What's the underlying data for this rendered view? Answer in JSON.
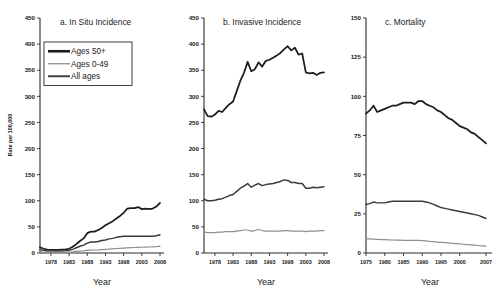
{
  "figure": {
    "background": "#ffffff",
    "series_colors": {
      "ages_50plus": "#1c1c1c",
      "ages_0_49": "#8f8f8f",
      "all_ages": "#3a3a3a"
    },
    "shared_ylabel": "Rate per 100,000",
    "shared_xlabel": "Year",
    "legend": {
      "position": "panel-a upper-left",
      "entries": [
        {
          "label": "Ages 50+",
          "color": "#1c1c1c",
          "width": 2.6
        },
        {
          "label": "Ages 0-49",
          "color": "#8f8f8f",
          "width": 1.3
        },
        {
          "label": "All ages",
          "color": "#3a3a3a",
          "width": 1.9
        }
      ]
    }
  },
  "chart_data": [
    {
      "type": "line",
      "id": "panel-a",
      "title": "a. In Situ Incidence",
      "xlabel": "Year",
      "ylabel": "Rate per 100,000",
      "xlim": [
        1975,
        2008
      ],
      "ylim": [
        0,
        450
      ],
      "yticks": [
        0,
        50,
        100,
        150,
        200,
        250,
        300,
        350,
        400,
        450
      ],
      "xticks": [
        1978,
        1983,
        1988,
        1993,
        1998,
        2003,
        2008
      ],
      "xticklabels": [
        "1978",
        "1983",
        "1988",
        "1993",
        "1998",
        "2003",
        "2008"
      ],
      "grid": false,
      "legend_shown": true,
      "x": [
        1975,
        1976,
        1977,
        1978,
        1979,
        1980,
        1981,
        1982,
        1983,
        1984,
        1985,
        1986,
        1987,
        1988,
        1989,
        1990,
        1991,
        1992,
        1993,
        1994,
        1995,
        1996,
        1997,
        1998,
        1999,
        2000,
        2001,
        2002,
        2003,
        2004,
        2005,
        2006,
        2007,
        2008
      ],
      "series": [
        {
          "name": "Ages 50+",
          "color": "#1c1c1c",
          "values": [
            11,
            8,
            6.5,
            6,
            6,
            6,
            6.5,
            7,
            8,
            12,
            17,
            23,
            28,
            38,
            41,
            41,
            44,
            48,
            53,
            57,
            61,
            66,
            71,
            77,
            85,
            86,
            86,
            88,
            84,
            85,
            84,
            85,
            89,
            96
          ]
        },
        {
          "name": "All ages",
          "color": "#3a3a3a",
          "values": [
            6.5,
            5,
            4,
            3.8,
            3.8,
            3.8,
            4,
            4.4,
            5,
            7,
            10,
            13,
            15,
            19,
            21,
            21,
            22,
            24,
            25,
            27,
            28,
            30,
            31,
            32,
            32,
            32,
            32,
            32,
            32,
            32,
            32,
            32,
            33,
            35
          ]
        },
        {
          "name": "Ages 0-49",
          "color": "#8f8f8f",
          "values": [
            2,
            1.6,
            1.4,
            1.3,
            1.3,
            1.3,
            1.4,
            1.6,
            1.8,
            2.3,
            3,
            3.6,
            4,
            5,
            5.5,
            5.7,
            6,
            6.5,
            7,
            7.5,
            8,
            8.6,
            9,
            9.5,
            10,
            10.2,
            10.5,
            10.8,
            11,
            11.2,
            11.5,
            11.8,
            12.2,
            13
          ]
        }
      ]
    },
    {
      "type": "line",
      "id": "panel-b",
      "title": "b. Invasive Incidence",
      "xlabel": "Year",
      "ylabel": "Rate per 100,000",
      "xlim": [
        1975,
        2008
      ],
      "ylim": [
        0,
        450
      ],
      "yticks": [
        0,
        50,
        100,
        150,
        200,
        250,
        300,
        350,
        400,
        450
      ],
      "xticks": [
        1978,
        1983,
        1988,
        1993,
        1998,
        2003,
        2008
      ],
      "xticklabels": [
        "1978",
        "1983",
        "1988",
        "1993",
        "1998",
        "2003",
        "2008"
      ],
      "grid": false,
      "legend_shown": false,
      "x": [
        1975,
        1976,
        1977,
        1978,
        1979,
        1980,
        1981,
        1982,
        1983,
        1984,
        1985,
        1986,
        1987,
        1988,
        1989,
        1990,
        1991,
        1992,
        1993,
        1994,
        1995,
        1996,
        1997,
        1998,
        1999,
        2000,
        2001,
        2002,
        2003,
        2004,
        2005,
        2006,
        2007,
        2008
      ],
      "series": [
        {
          "name": "Ages 50+",
          "color": "#1c1c1c",
          "values": [
            275,
            262,
            261,
            265,
            272,
            270,
            278,
            285,
            290,
            310,
            330,
            345,
            366,
            348,
            352,
            365,
            357,
            368,
            370,
            374,
            378,
            383,
            390,
            396,
            388,
            393,
            380,
            382,
            346,
            344,
            345,
            341,
            345,
            346
          ]
        },
        {
          "name": "All ages",
          "color": "#3a3a3a",
          "values": [
            103,
            100,
            100,
            101,
            103,
            104,
            107,
            110,
            112,
            118,
            124,
            128,
            133,
            126,
            130,
            133,
            129,
            131,
            132,
            133,
            135,
            137,
            140,
            139,
            135,
            135,
            133,
            133,
            124,
            124,
            126,
            125,
            126,
            127
          ]
        },
        {
          "name": "Ages 0-49",
          "color": "#8f8f8f",
          "values": [
            40,
            39,
            39,
            39,
            40,
            40,
            41,
            41,
            41,
            42,
            43,
            44,
            44,
            42,
            43,
            45,
            43,
            42,
            42,
            42,
            42,
            42,
            43,
            43,
            42,
            42,
            42,
            42,
            41,
            42,
            42,
            42,
            43,
            43
          ]
        }
      ]
    },
    {
      "type": "line",
      "id": "panel-c",
      "title": "c. Mortality",
      "xlabel": "Year",
      "ylabel": "Rate per 100,000",
      "xlim": [
        1975,
        2007
      ],
      "ylim": [
        0,
        150
      ],
      "yticks": [
        0,
        25,
        50,
        75,
        100,
        125,
        150
      ],
      "xticks": [
        1975,
        1980,
        1985,
        1990,
        1995,
        2000,
        2007
      ],
      "xticklabels": [
        "1975",
        "1980",
        "1985",
        "1990",
        "1995",
        "2000",
        "2007"
      ],
      "grid": false,
      "legend_shown": false,
      "x": [
        1975,
        1976,
        1977,
        1978,
        1979,
        1980,
        1981,
        1982,
        1983,
        1984,
        1985,
        1986,
        1987,
        1988,
        1989,
        1990,
        1991,
        1992,
        1993,
        1994,
        1995,
        1996,
        1997,
        1998,
        1999,
        2000,
        2001,
        2002,
        2003,
        2004,
        2005,
        2006,
        2007
      ],
      "series": [
        {
          "name": "Ages 50+",
          "color": "#1c1c1c",
          "values": [
            89,
            91,
            94,
            90,
            91,
            92,
            93,
            94,
            94,
            95,
            96,
            96,
            96,
            95,
            97,
            97,
            95,
            94,
            93,
            91,
            90,
            88,
            86,
            85,
            83,
            81,
            80,
            79,
            77,
            76,
            74,
            72,
            70
          ]
        },
        {
          "name": "All ages",
          "color": "#3a3a3a",
          "values": [
            31,
            31.5,
            32.5,
            32,
            32,
            32,
            32.5,
            33,
            33,
            33,
            33,
            33,
            33,
            33,
            33,
            33,
            32.5,
            32,
            31,
            30,
            29,
            28.5,
            28,
            27.5,
            27,
            26.5,
            26,
            25.5,
            25,
            24.5,
            24,
            23,
            22
          ]
        },
        {
          "name": "Ages 0-49",
          "color": "#8f8f8f",
          "values": [
            9,
            9,
            8.8,
            8.7,
            8.6,
            8.5,
            8.4,
            8.3,
            8.2,
            8.2,
            8.1,
            8,
            8,
            8,
            8,
            7.9,
            7.7,
            7.4,
            7.2,
            7,
            6.8,
            6.6,
            6.4,
            6.2,
            6,
            5.8,
            5.6,
            5.4,
            5.2,
            5,
            4.8,
            4.6,
            4.4
          ]
        }
      ]
    }
  ]
}
